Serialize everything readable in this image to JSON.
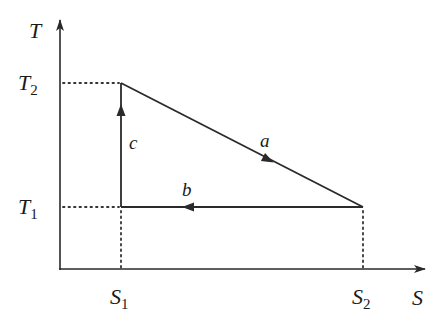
{
  "diagram": {
    "type": "T-S cycle diagram",
    "axes": {
      "y_label": "T",
      "x_label": "S",
      "y_ticks": [
        {
          "name": "T",
          "sub": "2"
        },
        {
          "name": "T",
          "sub": "1"
        }
      ],
      "x_ticks": [
        {
          "name": "S",
          "sub": "1"
        },
        {
          "name": "S",
          "sub": "2"
        }
      ]
    },
    "vertices": [
      {
        "id": "top",
        "s": "S1",
        "t": "T2"
      },
      {
        "id": "bottom-left",
        "s": "S1",
        "t": "T1"
      },
      {
        "id": "bottom-right",
        "s": "S2",
        "t": "T1"
      }
    ],
    "processes": [
      {
        "label": "a",
        "from": "top",
        "to": "bottom-right",
        "direction": "down-right"
      },
      {
        "label": "b",
        "from": "bottom-right",
        "to": "bottom-left",
        "direction": "left"
      },
      {
        "label": "c",
        "from": "bottom-left",
        "to": "top",
        "direction": "up"
      }
    ],
    "colors": {
      "line": "#2a2a2a",
      "background": "#ffffff"
    }
  }
}
